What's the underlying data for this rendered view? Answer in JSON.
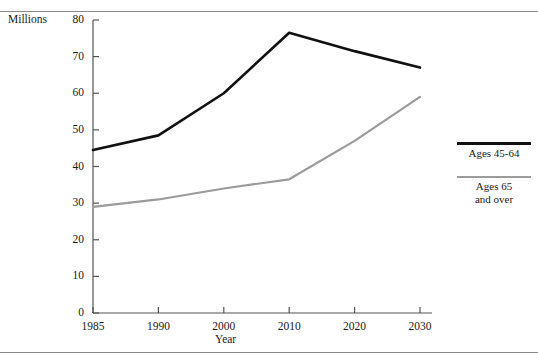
{
  "figure": {
    "top_caption": "",
    "units_label": "Millions",
    "x_axis_label": "Year"
  },
  "legend": {
    "entries": [
      {
        "label": "Ages 45-64",
        "color": "#111111"
      },
      {
        "label": "Ages 65",
        "label2": "and over",
        "color": "#9b9b9b"
      }
    ],
    "series1_label": "Ages 45-64",
    "series2_label_line1": "Ages 65",
    "series2_label_line2": "and over"
  },
  "axes": {
    "y_ticks": [
      "0",
      "10",
      "20",
      "30",
      "40",
      "50",
      "60",
      "70",
      "80"
    ],
    "x_ticks": [
      "1985",
      "1990",
      "2000",
      "2010",
      "2020",
      "2030"
    ]
  },
  "chart_data": {
    "type": "line",
    "title": "",
    "xlabel": "Year",
    "ylabel": "Millions",
    "categories": [
      "1985",
      "1990",
      "2000",
      "2010",
      "2020",
      "2030"
    ],
    "ylim": [
      0,
      80
    ],
    "ytick_step": 10,
    "grid": false,
    "legend_position": "right",
    "series": [
      {
        "name": "Ages 45-64",
        "color": "#111111",
        "values": [
          44.5,
          48.5,
          60.0,
          76.5,
          71.5,
          67.0
        ]
      },
      {
        "name": "Ages 65 and over",
        "color": "#9b9b9b",
        "values": [
          29.0,
          31.0,
          34.0,
          36.5,
          47.0,
          59.0
        ]
      }
    ]
  }
}
